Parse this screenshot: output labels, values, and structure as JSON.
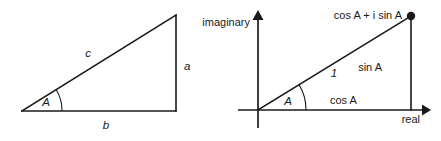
{
  "figure": {
    "background_color": "#ffffff",
    "ink_color": "#1a1a1a",
    "left_diagram": {
      "name": "right-triangle",
      "labels": {
        "hypotenuse": "c",
        "opposite": "a",
        "adjacent": "b",
        "angle": "A"
      },
      "geometry": {
        "vertex_angle": [
          22,
          111
        ],
        "vertex_right": [
          176,
          111
        ],
        "vertex_top": [
          176,
          15
        ],
        "arc_radius": 40
      }
    },
    "right_diagram": {
      "name": "complex-plane-unit-circle-point",
      "labels": {
        "imaginary_axis": "imaginary",
        "real_axis": "real",
        "point": "cos A + i sin A",
        "radius": "1",
        "vertical_leg": "sin A",
        "horizontal_leg": "cos A",
        "angle": "A"
      },
      "geometry": {
        "origin": [
          258,
          110
        ],
        "point": [
          411,
          16
        ],
        "real_axis_from_x": 238,
        "real_axis_to_x": 428,
        "imag_axis_from_y": 128,
        "imag_axis_to_y": 12,
        "arc_radius": 48
      }
    }
  }
}
